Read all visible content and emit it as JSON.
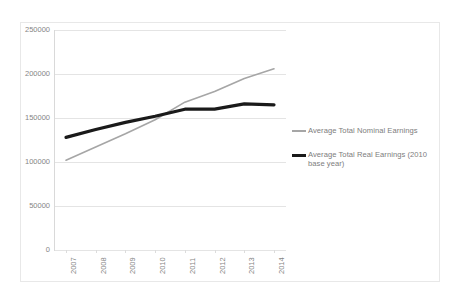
{
  "chart_data": {
    "type": "line",
    "title": "",
    "xlabel": "",
    "ylabel": "",
    "categories": [
      "2007",
      "2008",
      "2009",
      "2010",
      "2011",
      "2012",
      "2013",
      "2014"
    ],
    "x": [
      2007,
      2008,
      2009,
      2010,
      2011,
      2012,
      2013,
      2014
    ],
    "ylim": [
      0,
      250000
    ],
    "yticks": [
      0,
      50000,
      100000,
      150000,
      200000,
      250000
    ],
    "ytick_labels": [
      "0",
      "50000",
      "100000",
      "150000",
      "200000",
      "250000"
    ],
    "grid": true,
    "legend_position": "right",
    "series": [
      {
        "name": "Average Total Nominal Earnings",
        "color": "#a6a6a6",
        "width": 1.6,
        "values": [
          102000,
          117000,
          132000,
          148000,
          168000,
          180000,
          195000,
          206000
        ]
      },
      {
        "name": "Average Total Real Earnings (2010 base year)",
        "color": "#1a1a1a",
        "width": 3.2,
        "values": [
          128000,
          137000,
          145000,
          152000,
          160000,
          160000,
          166000,
          165000
        ]
      }
    ]
  },
  "legend": {
    "entries": [
      {
        "label": "Average Total Nominal Earnings"
      },
      {
        "label": "Average Total Real Earnings (2010 base year)"
      }
    ]
  },
  "colors": {
    "nominal": "#a6a6a6",
    "real": "#1a1a1a",
    "grid": "#e4e4e4",
    "axis": "#d9d9d9",
    "tick_text": "#858585"
  }
}
